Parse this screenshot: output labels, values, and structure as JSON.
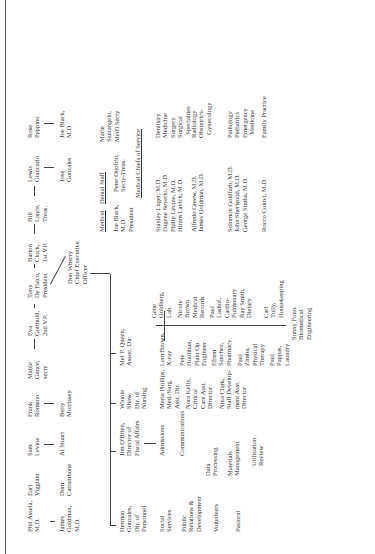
{
  "board": {
    "top_row": [
      {
        "name": "Phil Assela,\nM.D."
      },
      {
        "name": "Earl\nViggiani"
      },
      {
        "name": "Sam\nLevine"
      },
      {
        "name": "Frank\nRomano"
      },
      {
        "name": "Mable\nGance,\nsecty"
      },
      {
        "name": "Eva\nGotthuld,\n2nd V.P."
      },
      {
        "name": "Tony\nDe Falco,\nPresident"
      },
      {
        "name": "Barton\nClock,\n1st V.P."
      },
      {
        "name": "Bill\nLance,\nTreas."
      },
      {
        "name": "Lewis\nGiancarlo"
      },
      {
        "name": "Rose\nPeppino"
      }
    ],
    "second_row": [
      {
        "name": "James\nGoldman,\nM.D."
      },
      {
        "name": "Dom\nCatrambone"
      },
      {
        "name": "Al Stuart"
      },
      {
        "name": "Betty\nMorrissey"
      },
      {
        "name": "Jose\nGonzales"
      },
      {
        "name": "Joe Black,\nM.D."
      }
    ]
  },
  "ceo": {
    "name": "Don Wherry\nChief Executive\nOfficer"
  },
  "directors": [
    {
      "name": "Herman\nGonzales,\nDir. of\nPersonnel"
    },
    {
      "name": "Jim O'Brien,\nDirector of\nFiscal Affairs"
    },
    {
      "name": "Winnie\nShaw,\nDir. of\nNursing"
    },
    {
      "name": "Mel P. Queen,\nAssoc. Dir."
    }
  ],
  "personnel_depts": [
    "Social\nServices",
    "Public\nRelations &\nDevelopment",
    "Volunteers",
    "Pastoral"
  ],
  "fiscal_depts": [
    "Admissions",
    "Communications",
    "Data\nProcessing",
    "Materials\nManagement",
    "Utilization\nReview"
  ],
  "nursing_staff": [
    {
      "name": "Maria Phillips,\nMed./Surg.\nAsst. Dir."
    },
    {
      "name": "Nora Kelly,\nCritical\nCare Asst.\nDirector"
    },
    {
      "name": "Nina Clark,\nStaff Develop-\nment Asst.\nDirector"
    }
  ],
  "assoc_left": [
    {
      "name": "Lem Brown,\nX-ray"
    },
    {
      "name": "Pete\nHoolihan,\nPlant Op.\nEngineer"
    },
    {
      "name": "Efrem\nSanchez,\nPharmacy"
    },
    {
      "name": "Paul\nZimba,\nPhysical\nTherapy"
    },
    {
      "name": "Paul\nPappas,\nLaundry"
    }
  ],
  "assoc_right": [
    {
      "name": "Gene\nGoldberg,\nLab."
    },
    {
      "name": "Nicole\nBrown\nMedical\nRecords"
    },
    {
      "name": "Paul\nLashof,\nCardio-\nPulmonary"
    },
    {
      "name": "Ray Smith,\nDietary"
    },
    {
      "name": "Carl\nTully,\nHousekeeping"
    }
  ],
  "assoc_bottom": {
    "name": "Sunny Fono,\nBiomedical\nEngineering"
  },
  "medical_staff": {
    "medical_label": "Medical",
    "dental_label": "Dental Staff",
    "officers": [
      {
        "name": "Joe Black,\nM.D.\nPresident"
      },
      {
        "name": "Peter Onofrio,\nSecty-Treas."
      },
      {
        "name": "Marie\nSantangelo,\nMed'l Secty"
      }
    ],
    "chiefs_title": "Medical Chiefs of Service",
    "chiefs_group1": "Stanley Luger, M.D.\nEugene Severio, M.D.\nPhilip Levine, M.D.\nHiram Lavich, M.D.",
    "services_group1": "Dentistry\nMedicine\nSurgery\nSurgical\n  Specialties",
    "chiefs_group2": "Alfredo Greew, M.D.\nJames Goldman, M.D.",
    "services_group2": "Radiology\nObstetrics-\n  Gynecology",
    "chiefs_group3": "Solomon Goldfarb, M.D.\nJohn Sherwood, M.D.\nGeorge Simba, M.D.",
    "services_group3": "Pathology\nPediatrics\nEmergency\n  Medicine",
    "chiefs_group4": "Rocco Colovi, M.D.",
    "services_group4": "Family Practice"
  }
}
